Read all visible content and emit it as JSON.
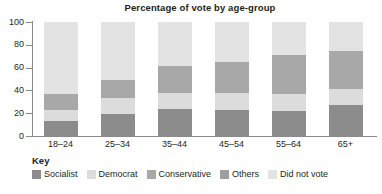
{
  "chart_data": {
    "type": "bar",
    "subtype": "stacked-bar-100",
    "title": "Percentage of vote by age-group",
    "xlabel": "",
    "ylabel": "",
    "ylim": [
      0,
      100
    ],
    "yticks": [
      0,
      20,
      40,
      60,
      80,
      100
    ],
    "grid": false,
    "legend_position": "bottom-left",
    "legend_title": "Key",
    "categories": [
      "18–24",
      "25–34",
      "35–44",
      "45–54",
      "55–64",
      "65+"
    ],
    "series": [
      {
        "name": "Socialist",
        "color": "#8c8c8c",
        "values": [
          13,
          19,
          24,
          23,
          22,
          27
        ]
      },
      {
        "name": "Democrat",
        "color": "#dcdcdc",
        "values": [
          10,
          14,
          14,
          15,
          15,
          14
        ]
      },
      {
        "name": "Conservative",
        "color": "#a8a8a8",
        "values": [
          14,
          16,
          23,
          27,
          34,
          34
        ]
      },
      {
        "name": "Others",
        "color": "#9e9e9e",
        "values": [
          0,
          0,
          0,
          0,
          0,
          0
        ]
      },
      {
        "name": "Did not vote",
        "color": "#e3e3e3",
        "values": [
          63,
          51,
          39,
          35,
          29,
          25
        ]
      }
    ]
  },
  "title": {
    "text": "Percentage of vote by age-group"
  },
  "y_axis": {
    "ticks": [
      "100",
      "80",
      "60",
      "40",
      "20",
      "0"
    ]
  },
  "x_axis": {
    "labels": [
      "18–24",
      "25–34",
      "35–44",
      "45–54",
      "55–64",
      "65+"
    ]
  },
  "key": {
    "heading": "Key",
    "items": [
      {
        "label": "Socialist",
        "color": "#8c8c8c"
      },
      {
        "label": "Democrat",
        "color": "#dcdcdc"
      },
      {
        "label": "Conservative",
        "color": "#a8a8a8"
      },
      {
        "label": "Others",
        "color": "#9e9e9e"
      },
      {
        "label": "Did not vote",
        "color": "#e3e3e3"
      }
    ]
  }
}
